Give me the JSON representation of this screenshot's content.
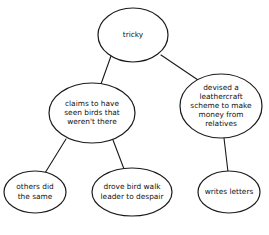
{
  "diagram": {
    "type": "node-link-tree",
    "background_color": "#ffffff",
    "stroke_color": "#1a1a1a",
    "text_color": "#111111",
    "node_shape": "ellipse",
    "nodes": [
      {
        "id": "root",
        "name": "node-tricky",
        "lines": [
          "tricky"
        ],
        "cx": 133,
        "cy": 35,
        "rx": 35,
        "ry": 27
      },
      {
        "id": "claims",
        "name": "node-claims-to-have-seen-birds",
        "lines": [
          "claims to have",
          "seen birds that",
          "weren't there"
        ],
        "cx": 92,
        "cy": 113,
        "rx": 43,
        "ry": 30
      },
      {
        "id": "devised",
        "name": "node-devised-leathercraft-scheme",
        "lines": [
          "devised a",
          "leathercraft",
          "scheme to make",
          "money from",
          "relatives"
        ],
        "cx": 221,
        "cy": 106,
        "rx": 41,
        "ry": 32
      },
      {
        "id": "others",
        "name": "node-others-did-the-same",
        "lines": [
          "others did",
          "the same"
        ],
        "cx": 35,
        "cy": 192,
        "rx": 31,
        "ry": 21
      },
      {
        "id": "drove",
        "name": "node-drove-bird-walk-leader",
        "lines": [
          "drove bird walk",
          "leader to despair"
        ],
        "cx": 132,
        "cy": 192,
        "rx": 40,
        "ry": 24
      },
      {
        "id": "writes",
        "name": "node-writes-letters",
        "lines": [
          "writes letters"
        ],
        "cx": 229,
        "cy": 192,
        "rx": 31,
        "ry": 21
      }
    ],
    "edges": [
      {
        "id": "e1",
        "name": "edge-tricky-to-claims",
        "from": "root",
        "to": "claims",
        "x1": 111,
        "y1": 56,
        "x2": 101,
        "y2": 84
      },
      {
        "id": "e2",
        "name": "edge-tricky-to-devised",
        "from": "root",
        "to": "devised",
        "x1": 161,
        "y1": 55,
        "x2": 198,
        "y2": 80
      },
      {
        "id": "e3",
        "name": "edge-claims-to-others",
        "from": "claims",
        "to": "others",
        "x1": 66,
        "y1": 139,
        "x2": 45,
        "y2": 173
      },
      {
        "id": "e4",
        "name": "edge-claims-to-drove",
        "from": "claims",
        "to": "drove",
        "x1": 113,
        "y1": 140,
        "x2": 124,
        "y2": 169
      },
      {
        "id": "e5",
        "name": "edge-devised-to-writes",
        "from": "devised",
        "to": "writes",
        "x1": 224,
        "y1": 138,
        "x2": 228,
        "y2": 172
      }
    ]
  }
}
